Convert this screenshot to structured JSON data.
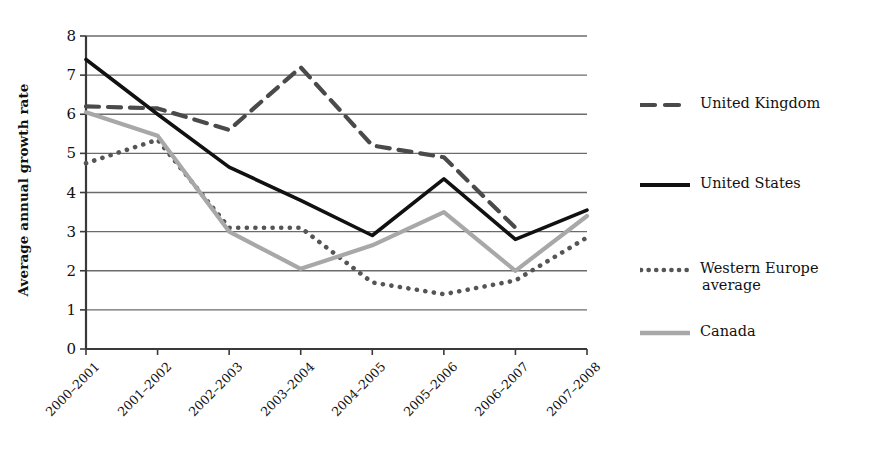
{
  "chart_data": {
    "type": "line",
    "title": "",
    "xlabel": "",
    "ylabel": "Average annual growth rate",
    "ylim": [
      0,
      8
    ],
    "yticks": [
      0,
      1,
      2,
      3,
      4,
      5,
      6,
      7,
      8
    ],
    "grid": true,
    "legend_position": "right",
    "categories": [
      "2000–2001",
      "2001–2002",
      "2002–2003",
      "2003–2004",
      "2004–2005",
      "2005–2006",
      "2006–2007",
      "2007–2008"
    ],
    "series": [
      {
        "name": "United Kingdom",
        "style": "dashed",
        "color": "#4a4a4a",
        "values": [
          6.2,
          6.15,
          5.6,
          7.2,
          5.2,
          4.9,
          3.1,
          null
        ]
      },
      {
        "name": "United States",
        "style": "solid",
        "color": "#111111",
        "values": [
          7.4,
          6.0,
          4.65,
          3.8,
          2.9,
          4.35,
          2.8,
          3.55
        ]
      },
      {
        "name": "Western Europe average",
        "style": "dotted",
        "color": "#555555",
        "values": [
          4.75,
          5.35,
          3.1,
          3.1,
          1.7,
          1.4,
          1.75,
          2.85
        ]
      },
      {
        "name": "Canada",
        "style": "solid",
        "color": "#a8a8a8",
        "values": [
          6.05,
          5.45,
          3.0,
          2.05,
          2.65,
          3.5,
          2.0,
          3.4
        ]
      }
    ]
  },
  "legend": {
    "items": [
      {
        "label": "United Kingdom",
        "style": "dashed",
        "color": "#4a4a4a"
      },
      {
        "label": "United States",
        "style": "solid",
        "color": "#111111"
      },
      {
        "label": "Western Europe\naverage",
        "style": "dotted",
        "color": "#555555"
      },
      {
        "label": "Canada",
        "style": "solid",
        "color": "#a8a8a8"
      }
    ]
  },
  "axes": {
    "y_title": "Average annual growth rate",
    "y_tick_labels": [
      "8",
      "7",
      "6",
      "5",
      "4",
      "3",
      "2",
      "1",
      "0"
    ],
    "x_tick_labels": [
      "2000–2001",
      "2001–2002",
      "2002–2003",
      "2003–2004",
      "2004–2005",
      "2005–2006",
      "2006–2007",
      "2007–2008"
    ]
  }
}
